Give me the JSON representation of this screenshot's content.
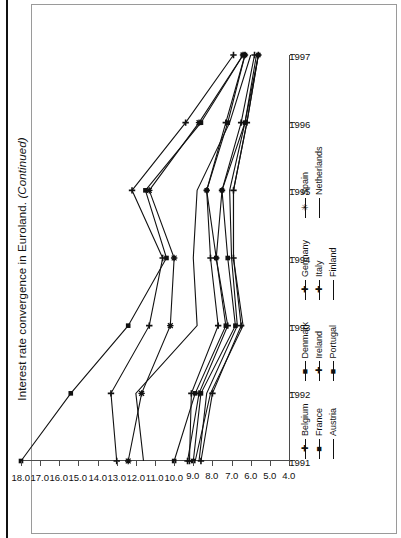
{
  "figure": {
    "caption_main": "Interest rate convergence in Euroland.",
    "caption_suffix": "(Continued)",
    "caption_full": "Interest rate convergence in Euroland. (Continued)"
  },
  "chart_data": {
    "type": "line",
    "title": "Interest rate convergence in Euroland. (Continued)",
    "xlabel": "",
    "ylabel": "",
    "orientation": "rotated-90-ccw",
    "grid": false,
    "legend_position": "bottom",
    "x": [
      "1991",
      "1992",
      "1993",
      "1994",
      "1995",
      "1996",
      "1997"
    ],
    "xlim": [
      "1991",
      "1997"
    ],
    "ylim": [
      4.0,
      18.0
    ],
    "yticks": [
      "18.0",
      "17.0",
      "16.0",
      "15.0",
      "14.0",
      "13.0",
      "12.0",
      "11.0",
      "10.0",
      "9.0",
      "8.0",
      "7.0",
      "6.0",
      "5.0",
      "4.0"
    ],
    "ytick_values": [
      18.0,
      17.0,
      16.0,
      15.0,
      14.0,
      13.0,
      12.0,
      11.0,
      10.0,
      9.0,
      8.0,
      7.0,
      6.0,
      5.0,
      4.0
    ],
    "xticks": [
      "1991",
      "1992",
      "1993",
      "1994",
      "1995",
      "1996",
      "1997"
    ],
    "series": [
      {
        "name": "Belgium",
        "marker": "plus",
        "values": [
          9.3,
          8.7,
          7.2,
          7.8,
          7.5,
          6.5,
          5.8
        ]
      },
      {
        "name": "France",
        "marker": "square",
        "values": [
          9.0,
          8.6,
          6.8,
          7.2,
          7.5,
          6.3,
          5.6
        ]
      },
      {
        "name": "Austria",
        "marker": "none",
        "values": [
          8.7,
          8.3,
          6.7,
          7.0,
          7.1,
          6.3,
          5.7
        ]
      },
      {
        "name": "Denmark",
        "marker": "square",
        "values": [
          10.0,
          8.9,
          7.3,
          7.8,
          8.3,
          7.2,
          6.3
        ]
      },
      {
        "name": "Ireland",
        "marker": "plus",
        "values": [
          9.2,
          9.1,
          7.7,
          8.1,
          8.3,
          7.3,
          6.3
        ]
      },
      {
        "name": "Portugal",
        "marker": "square",
        "values": [
          18.0,
          15.4,
          12.4,
          10.4,
          11.5,
          8.6,
          6.4
        ]
      },
      {
        "name": "Germany",
        "marker": "plus",
        "values": [
          8.6,
          8.0,
          6.5,
          6.9,
          6.9,
          6.2,
          5.6
        ]
      },
      {
        "name": "Italy",
        "marker": "plus",
        "values": [
          13.0,
          13.3,
          11.3,
          10.6,
          12.2,
          9.4,
          6.9
        ]
      },
      {
        "name": "Finland",
        "marker": "none",
        "values": [
          11.6,
          12.0,
          8.8,
          9.0,
          8.8,
          7.1,
          6.0
        ]
      },
      {
        "name": "Spain",
        "marker": "star",
        "values": [
          12.4,
          11.7,
          10.2,
          10.0,
          11.3,
          8.7,
          6.4
        ]
      },
      {
        "name": "Netherlands",
        "marker": "none",
        "values": [
          8.9,
          8.1,
          6.4,
          6.9,
          6.9,
          6.2,
          5.6
        ]
      }
    ],
    "legend_columns": [
      [
        "Belgium",
        "France",
        "Austria"
      ],
      [
        "Denmark",
        "Ireland",
        "Portugal"
      ],
      [
        "Germany",
        "Italy",
        "Finland"
      ],
      [
        "Spain",
        "Netherlands"
      ]
    ]
  },
  "colors": {
    "line": "#111111",
    "axis": "#4b4b4b",
    "frame": "#9a9a9a",
    "background": "#ffffff"
  }
}
